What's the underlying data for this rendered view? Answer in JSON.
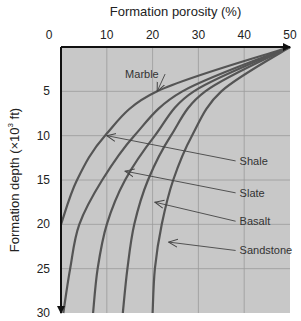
{
  "chart_data": {
    "type": "line",
    "title": "Formation porosity (%)",
    "xlabel": "Formation porosity (%)",
    "ylabel": "Formation depth (×10³ ft)",
    "ylabel_prefix": "Formation depth (×10",
    "ylabel_sup": "3",
    "ylabel_suffix": " ft)",
    "xlim": [
      0,
      50
    ],
    "ylim": [
      30,
      0
    ],
    "x_axis_position": "top",
    "y_axis_inverted": true,
    "grid": true,
    "background": "#c8c8c8",
    "line_color": "#555555",
    "x_ticks": [
      0,
      10,
      20,
      30,
      40,
      50
    ],
    "y_ticks": [
      5,
      10,
      15,
      20,
      25,
      30
    ],
    "y_tick_zero_label": "0",
    "depth": [
      0,
      5,
      10,
      15,
      20,
      25,
      30
    ],
    "series": [
      {
        "name": "Marble",
        "label": "Marble",
        "porosity": [
          50,
          21,
          9.6,
          3.5,
          0,
          null,
          null
        ]
      },
      {
        "name": "Shale",
        "label": "Shale",
        "porosity": [
          50,
          26.5,
          16,
          9,
          4,
          2,
          0.5
        ]
      },
      {
        "name": "Slate",
        "label": "Slate",
        "porosity": [
          50,
          29,
          20.5,
          14,
          10,
          8,
          7
        ]
      },
      {
        "name": "Basalt",
        "label": "Basalt",
        "porosity": [
          50,
          31.5,
          24,
          19,
          16,
          14.5,
          13.5
        ]
      },
      {
        "name": "Sandstone",
        "label": "Sandstone",
        "porosity": [
          50,
          35,
          28.6,
          24.5,
          22,
          20.5,
          20
        ]
      }
    ],
    "annotations": [
      {
        "text": "Marble",
        "label_pos": [
          14,
          3.5
        ],
        "arrow_to": [
          21,
          5
        ]
      },
      {
        "text": "Shale",
        "label_pos": [
          39,
          13.3
        ],
        "arrow_to": [
          10,
          10
        ]
      },
      {
        "text": "Slate",
        "label_pos": [
          39,
          16.9
        ],
        "arrow_to": [
          14,
          14
        ]
      },
      {
        "text": "Basalt",
        "label_pos": [
          39,
          20.1
        ],
        "arrow_to": [
          20.5,
          17.5
        ]
      },
      {
        "text": "Sandstone",
        "label_pos": [
          39,
          23.4
        ],
        "arrow_to": [
          23.5,
          22
        ]
      }
    ],
    "legend": "none (inline arrow labels)"
  }
}
